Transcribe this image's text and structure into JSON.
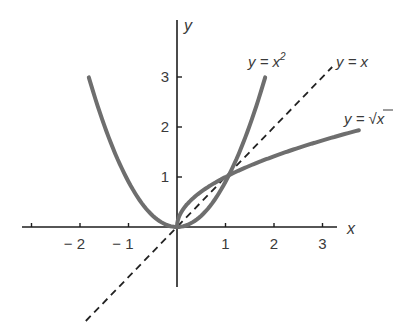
{
  "chart_data": {
    "type": "line",
    "title": "",
    "xlabel": "x",
    "ylabel": "y",
    "xlim": [
      -3,
      3.3
    ],
    "ylim": [
      -1.2,
      4.2
    ],
    "grid": false,
    "legend": "inline labels near curve ends",
    "x_ticks": [
      -3,
      -2,
      -1,
      1,
      2,
      3
    ],
    "x_tick_labels": [
      "",
      "− 2",
      "− 1",
      "1",
      "2",
      "3"
    ],
    "y_ticks": [
      1,
      2,
      3
    ],
    "y_tick_labels": [
      "1",
      "2",
      "3"
    ],
    "series": [
      {
        "name": "y = x²",
        "style": "solid",
        "color": "#6e6e6e",
        "x": [
          -1.73,
          -1.5,
          -1,
          -0.5,
          0,
          0.5,
          1,
          1.5,
          1.73
        ],
        "y": [
          3,
          2.25,
          1,
          0.25,
          0,
          0.25,
          1,
          2.25,
          3
        ]
      },
      {
        "name": "y = x",
        "style": "dashed",
        "color": "#222222",
        "x": [
          -1.88,
          3.2
        ],
        "y": [
          -1.88,
          3.2
        ]
      },
      {
        "name": "y = √x",
        "style": "solid",
        "color": "#6e6e6e",
        "x": [
          0,
          0.25,
          0.5,
          1,
          2,
          3,
          3.75
        ],
        "y": [
          0,
          0.5,
          0.71,
          1,
          1.41,
          1.73,
          1.94
        ]
      }
    ],
    "annotations": [
      {
        "text": "y = x²",
        "near": "top of parabola right branch"
      },
      {
        "text": "y = x",
        "near": "upper end of dashed line"
      },
      {
        "text": "y = √x",
        "near": "right end of sqrt curve"
      }
    ]
  },
  "axes": {
    "x_label": "x",
    "y_label": "y"
  },
  "ticks": {
    "x": [
      {
        "value": -2,
        "label": "− 2"
      },
      {
        "value": -1,
        "label": "− 1"
      },
      {
        "value": 1,
        "label": "1"
      },
      {
        "value": 2,
        "label": "2"
      },
      {
        "value": 3,
        "label": "3"
      }
    ],
    "y": [
      {
        "value": 1,
        "label": "1"
      },
      {
        "value": 2,
        "label": "2"
      },
      {
        "value": 3,
        "label": "3"
      }
    ]
  },
  "labels": {
    "parabola": {
      "prefix": "y = x",
      "sup": "2"
    },
    "identity": "y = x",
    "sqrt": {
      "prefix": "y = ",
      "radical": "√",
      "arg": "x"
    }
  },
  "colors": {
    "curve": "#6e6e6e",
    "axis": "#1e1e1e",
    "dashed": "#222222",
    "text": "#3a3a3a"
  }
}
